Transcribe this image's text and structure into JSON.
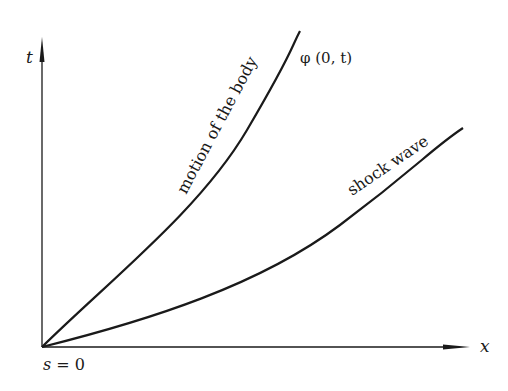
{
  "diagram": {
    "axes": {
      "y_label": "t",
      "x_label": "x",
      "origin_label": "s = 0"
    },
    "curves": [
      {
        "name": "body-motion",
        "label": "motion of the body",
        "end_label": "φ (0, t)"
      },
      {
        "name": "shock-wave",
        "label": "shock wave"
      }
    ],
    "colors": {
      "ink": "#1a1a1a",
      "background": "#ffffff"
    }
  }
}
